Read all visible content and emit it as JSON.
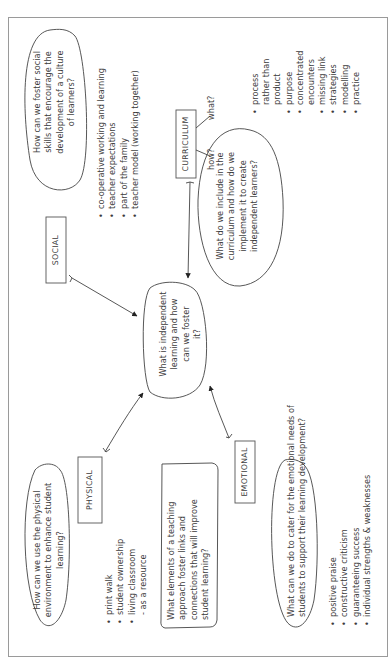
{
  "diagram": {
    "orientation": "rotated 90deg counter-clockwise",
    "central_question": [
      "What is independent",
      "learning and how",
      "can we foster",
      "it?"
    ],
    "categories": {
      "social": {
        "label": "SOCIAL",
        "question": [
          "How can we foster social",
          "skills that encourage the",
          "development of a culture",
          "of learners?"
        ],
        "points": [
          "co-operative working and learning",
          "teacher expectations",
          "part of the family",
          "teacher model (working together)"
        ]
      },
      "curriculum": {
        "label": "CURRICULUM",
        "branch_how": "how?",
        "branch_what": "what?",
        "question": [
          "What do we include in the",
          "curriculum and how do we",
          "implement it to create",
          "independent learners?"
        ],
        "points": [
          {
            "text": "process",
            "bullet": true
          },
          {
            "text": "rather than",
            "bullet": false
          },
          {
            "text": "product",
            "bullet": false
          },
          {
            "text": "purpose",
            "bullet": true
          },
          {
            "text": "concentrated",
            "bullet": true
          },
          {
            "text": "encounters",
            "bullet": false
          },
          {
            "text": "missing link",
            "bullet": true
          },
          {
            "text": "strategies",
            "bullet": true
          },
          {
            "text": "modelling",
            "bullet": true
          },
          {
            "text": "practice",
            "bullet": true
          }
        ]
      },
      "physical": {
        "label": "PHYSICAL",
        "question": [
          "How can we use the physical",
          "environment to enhance student",
          "learning?"
        ],
        "points": [
          {
            "text": "print walk",
            "bullet": true
          },
          {
            "text": "student ownership",
            "bullet": true
          },
          {
            "text": "living classroom",
            "bullet": true
          },
          {
            "text": "- as a resource",
            "bullet": false
          }
        ],
        "teaching_question": [
          "What elements of a teaching",
          "approach foster links and",
          "connections that will improve",
          "student learning?"
        ]
      },
      "emotional": {
        "label": "EMOTIONAL",
        "question": [
          "What can we do to cater for the emotional needs of",
          "students to support their learning development?"
        ],
        "points": [
          "positive praise",
          "constructive criticism",
          "guaranteeing success",
          "individual strengths & weaknesses"
        ]
      }
    },
    "colors": {
      "ink": "#3a3a3a",
      "frame": "#9a9a9a",
      "background": "#ffffff"
    }
  }
}
